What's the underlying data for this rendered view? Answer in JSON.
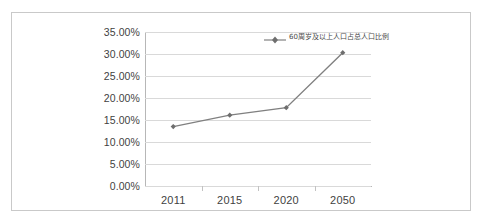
{
  "chart_data": {
    "type": "line",
    "title": "",
    "xlabel": "",
    "ylabel": "",
    "categories": [
      "2011",
      "2015",
      "2020",
      "2050"
    ],
    "series": [
      {
        "name": "60周岁及以上人口占总人口比例",
        "values": [
          13.5,
          16.1,
          17.8,
          30.3
        ]
      }
    ],
    "ylim": [
      0,
      35
    ],
    "ytick_labels": [
      "35.00%",
      "30.00%",
      "25.00%",
      "20.00%",
      "15.00%",
      "10.00%",
      "5.00%",
      "0.00%"
    ],
    "ytick_values": [
      35,
      30,
      25,
      20,
      15,
      10,
      5,
      0
    ],
    "grid": true,
    "legend_position": "top-right",
    "value_format": "percent",
    "series_color": "#808080",
    "grid_color": "#d9d9d9",
    "axis_color": "#b7b7b7",
    "text_color": "#3f3f3f"
  },
  "legend": {
    "entries": [
      {
        "label": "60周岁及以上人口占总人口比例",
        "color": "#808080",
        "marker": "diamond"
      }
    ]
  }
}
